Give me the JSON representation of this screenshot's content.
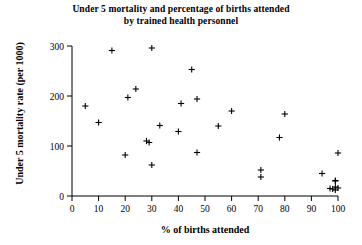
{
  "chart_data": {
    "type": "scatter",
    "title": "Under 5 mortality and percentage of births attended by trained health personnel",
    "title_line1": "Under 5 mortality and percentage of births attended",
    "title_line2": "by trained health personnel",
    "xlabel": "% of births attended",
    "ylabel": "Under 5 mortality rate (per 1000)",
    "xlim": [
      0,
      100
    ],
    "ylim": [
      0,
      300
    ],
    "xticks": [
      0,
      10,
      20,
      30,
      40,
      50,
      60,
      70,
      80,
      90,
      100
    ],
    "yticks": [
      0,
      100,
      200,
      300
    ],
    "xtick_labels": [
      "0",
      "10",
      "20",
      "30",
      "40",
      "50",
      "60",
      "70",
      "80",
      "90",
      "100"
    ],
    "ytick_labels": [
      "0",
      "100",
      "200",
      "300"
    ],
    "grid": false,
    "legend": false,
    "marker": "plus",
    "marker_color": "#000000",
    "points": [
      {
        "x": 5,
        "y": 180
      },
      {
        "x": 10,
        "y": 147
      },
      {
        "x": 15,
        "y": 291
      },
      {
        "x": 20,
        "y": 82
      },
      {
        "x": 21,
        "y": 197
      },
      {
        "x": 24,
        "y": 214
      },
      {
        "x": 28,
        "y": 110
      },
      {
        "x": 29,
        "y": 107
      },
      {
        "x": 30,
        "y": 62
      },
      {
        "x": 30,
        "y": 296
      },
      {
        "x": 33,
        "y": 141
      },
      {
        "x": 40,
        "y": 129
      },
      {
        "x": 41,
        "y": 185
      },
      {
        "x": 45,
        "y": 253
      },
      {
        "x": 47,
        "y": 194
      },
      {
        "x": 47,
        "y": 87
      },
      {
        "x": 55,
        "y": 140
      },
      {
        "x": 60,
        "y": 170
      },
      {
        "x": 71,
        "y": 52
      },
      {
        "x": 71,
        "y": 38
      },
      {
        "x": 78,
        "y": 117
      },
      {
        "x": 80,
        "y": 164
      },
      {
        "x": 94,
        "y": 45
      },
      {
        "x": 97,
        "y": 15
      },
      {
        "x": 98,
        "y": 14
      },
      {
        "x": 99,
        "y": 31
      },
      {
        "x": 99,
        "y": 30
      },
      {
        "x": 99,
        "y": 18
      },
      {
        "x": 99,
        "y": 12
      },
      {
        "x": 100,
        "y": 86
      },
      {
        "x": 100,
        "y": 16
      }
    ]
  },
  "axes": {
    "axis_color": "#000000"
  }
}
